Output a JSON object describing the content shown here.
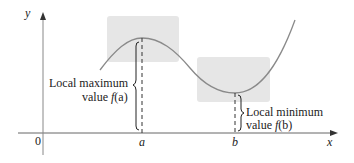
{
  "figure": {
    "axes": {
      "x_label": "x",
      "y_label": "y",
      "origin_label": "0"
    },
    "ticks": {
      "a": "a",
      "b": "b"
    },
    "labels": {
      "max_line1": "Local maximum",
      "max_line2_prefix": "value ",
      "max_fn": "f",
      "max_arg": "(a)",
      "min_line1": "Local minimum",
      "min_line2_prefix": "value ",
      "min_fn": "f",
      "min_arg": "(b)"
    },
    "colors": {
      "curve": "#8a8a8a",
      "box": "#e8e8e8",
      "axis": "#555555",
      "text": "#222222"
    }
  }
}
